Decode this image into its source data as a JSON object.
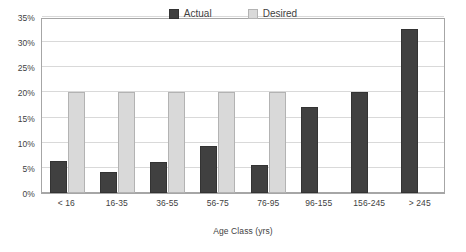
{
  "chart_data": {
    "type": "bar",
    "title": "",
    "xlabel": "Age Class (yrs)",
    "ylabel": "",
    "ylim": [
      0,
      35
    ],
    "ytick_labels": [
      "0%",
      "5%",
      "10%",
      "15%",
      "20%",
      "25%",
      "30%",
      "35%"
    ],
    "ytick_values": [
      0,
      5,
      10,
      15,
      20,
      25,
      30,
      35
    ],
    "grid": true,
    "legend_position": "top-center",
    "categories": [
      "< 16",
      "16-35",
      "36-55",
      "56-75",
      "76-95",
      "96-155",
      "156-245",
      "> 245"
    ],
    "series": [
      {
        "name": "Actual",
        "color": "#404040",
        "values": [
          6.3,
          4.2,
          6.2,
          9.4,
          5.5,
          17.2,
          20.0,
          32.7
        ]
      },
      {
        "name": "Desired",
        "color": "#d9d9d9",
        "values": [
          20.0,
          20.0,
          20.0,
          20.0,
          20.0,
          null,
          null,
          null
        ]
      }
    ]
  },
  "colors": {
    "actual": "#404040",
    "desired": "#d9d9d9",
    "gridline": "#d9d9d9",
    "axis": "#a6a6a6",
    "text": "#3f3f3f",
    "background": "#ffffff"
  }
}
